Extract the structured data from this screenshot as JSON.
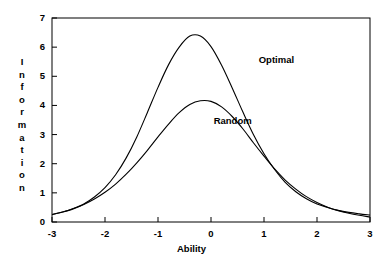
{
  "chart_data": {
    "type": "line",
    "title": "",
    "xlabel": "Ability",
    "ylabel": "Information",
    "ylabel_letters": [
      "I",
      "n",
      "f",
      "o",
      "r",
      "m",
      "a",
      "t",
      "i",
      "o",
      "n"
    ],
    "xlim": [
      -3,
      3
    ],
    "ylim": [
      0,
      7
    ],
    "xticks": [
      -3,
      -2,
      -1,
      0,
      1,
      2,
      3
    ],
    "xtick_labels": [
      "-3",
      "-2",
      "-1",
      "0",
      "1",
      "2",
      "3"
    ],
    "yticks": [
      0,
      1,
      2,
      3,
      4,
      5,
      6,
      7
    ],
    "ytick_labels": [
      "0",
      "1",
      "2",
      "3",
      "4",
      "5",
      "6",
      "7"
    ],
    "grid": false,
    "legend_position": "inline-annotation",
    "line_color": "#000000",
    "background_color": "#ffffff",
    "series": [
      {
        "name": "Optimal",
        "label_x": 0.9,
        "label_y": 5.55,
        "peak_x": -0.4,
        "peak_y": 6.4,
        "x": [
          -3.0,
          -2.8,
          -2.6,
          -2.4,
          -2.2,
          -2.0,
          -1.8,
          -1.6,
          -1.4,
          -1.2,
          -1.0,
          -0.8,
          -0.6,
          -0.4,
          -0.2,
          0.0,
          0.2,
          0.4,
          0.6,
          0.8,
          1.0,
          1.2,
          1.4,
          1.6,
          1.8,
          2.0,
          2.2,
          2.4,
          2.6,
          2.8,
          3.0
        ],
        "values": [
          0.26,
          0.34,
          0.46,
          0.62,
          0.86,
          1.18,
          1.62,
          2.2,
          2.92,
          3.76,
          4.62,
          5.4,
          6.0,
          6.38,
          6.38,
          6.02,
          5.38,
          4.6,
          3.78,
          3.0,
          2.34,
          1.8,
          1.36,
          1.04,
          0.8,
          0.62,
          0.5,
          0.4,
          0.33,
          0.28,
          0.24
        ]
      },
      {
        "name": "Random",
        "label_x": 0.05,
        "label_y": 3.45,
        "peak_x": -0.3,
        "peak_y": 4.17,
        "x": [
          -3.0,
          -2.8,
          -2.6,
          -2.4,
          -2.2,
          -2.0,
          -1.8,
          -1.6,
          -1.4,
          -1.2,
          -1.0,
          -0.8,
          -0.6,
          -0.4,
          -0.2,
          0.0,
          0.2,
          0.4,
          0.6,
          0.8,
          1.0,
          1.2,
          1.4,
          1.6,
          1.8,
          2.0,
          2.2,
          2.4,
          2.6,
          2.8,
          3.0
        ],
        "values": [
          0.25,
          0.34,
          0.45,
          0.6,
          0.79,
          1.02,
          1.3,
          1.64,
          2.03,
          2.46,
          2.92,
          3.36,
          3.75,
          4.03,
          4.16,
          4.14,
          3.95,
          3.62,
          3.2,
          2.72,
          2.26,
          1.82,
          1.44,
          1.13,
          0.87,
          0.67,
          0.51,
          0.39,
          0.3,
          0.23,
          0.17
        ]
      }
    ],
    "annotations": [
      {
        "text": "Optimal",
        "x": 0.9,
        "y": 5.55
      },
      {
        "text": "Random",
        "x": 0.05,
        "y": 3.45
      }
    ]
  },
  "axes": {
    "x_title": "Ability",
    "y_title": "Information"
  }
}
